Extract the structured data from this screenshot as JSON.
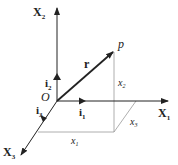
{
  "diagram": {
    "colors": {
      "axis": "#222222",
      "vector": "#222222",
      "projection": "#888888",
      "background": "#ffffff"
    },
    "axes": [
      {
        "name": "X1",
        "label": "X",
        "sub": "1"
      },
      {
        "name": "X2",
        "label": "X",
        "sub": "2"
      },
      {
        "name": "X3",
        "label": "X",
        "sub": "3"
      }
    ],
    "unit_vectors": [
      {
        "label": "i",
        "sub": "1"
      },
      {
        "label": "i",
        "sub": "2"
      },
      {
        "label": "i",
        "sub": "3"
      }
    ],
    "origin_label": "O",
    "point_label": "p",
    "vector_label": "r",
    "components": [
      {
        "label": "x",
        "sub": "1"
      },
      {
        "label": "x",
        "sub": "2"
      },
      {
        "label": "x",
        "sub": "3"
      }
    ]
  }
}
